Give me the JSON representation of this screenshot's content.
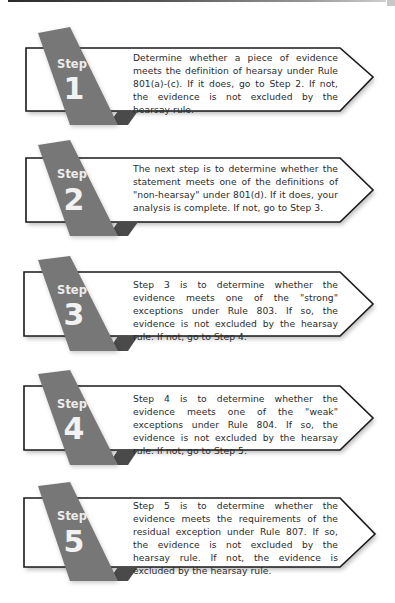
{
  "colors": {
    "ribbon": "#777777",
    "ribbon_fold": "#4a4a4a",
    "box_border": "#1a1a1a",
    "text": "#2b2b2b",
    "ribbon_text": "#ececec"
  },
  "steps": [
    {
      "label": "Step",
      "number": "1",
      "text": "Determine whether a piece of evidence meets the definition of hearsay under Rule 801(a)-(c). If it does, go to Step 2. If not, the evidence is not excluded by the hearsay rule."
    },
    {
      "label": "Step",
      "number": "2",
      "text": "The next step is to determine whether the statement  meets one of the definitions of \"non-hearsay\" under 801(d). If it does, your analysis is complete. If not, go to Step 3."
    },
    {
      "label": "Step",
      "number": "3",
      "text": "Step 3 is to determine whether the evidence meets one of the \"strong\" exceptions under Rule 803. If so, the evidence is not excluded by the hearsay rule. If not, go to Step 4."
    },
    {
      "label": "Step",
      "number": "4",
      "text": "Step 4 is to determine whether the evidence meets one of the \"weak\" exceptions under Rule 804. If so, the evidence is not excluded by the hearsay rule. If not, go to Step 5."
    },
    {
      "label": "Step",
      "number": "5",
      "text": "Step 5 is to determine whether the evidence meets the requirements of the residual exception under Rule 807. If so, the evidence is not excluded by the hearsay rule. If not, the evidence is excluded by the hearsay rule."
    }
  ]
}
